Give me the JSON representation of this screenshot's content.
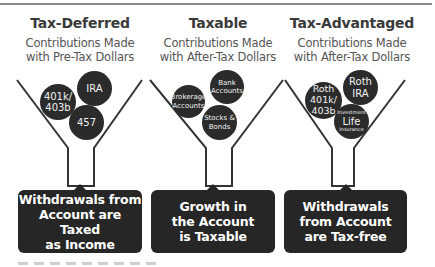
{
  "columns": [
    {
      "title": "Tax-Deferred",
      "subtitle_line1": "Contributions Made",
      "subtitle_line2": "with Pre-Tax Dollars",
      "accounts": [
        {
          "lines": [
            "401k/",
            "403b"
          ]
        },
        {
          "lines": [
            "IRA"
          ]
        },
        {
          "lines": [
            "457"
          ]
        }
      ],
      "outcome": [
        "Withdrawals from",
        "Account are Taxed",
        "as Income"
      ]
    },
    {
      "title": "Taxable",
      "subtitle_line1": "Contributions Made",
      "subtitle_line2": "with After-Tax Dollars",
      "accounts": [
        {
          "lines": [
            "Brokerage",
            "Accounts"
          ]
        },
        {
          "lines": [
            "Bank",
            "Accounts"
          ]
        },
        {
          "lines": [
            "Stocks &",
            "Bonds"
          ]
        }
      ],
      "outcome": [
        "Growth in",
        "the Account",
        "is Taxable"
      ]
    },
    {
      "title": "Tax-Advantaged",
      "subtitle_line1": "Contributions Made",
      "subtitle_line2": "with After-Tax Dollars",
      "accounts": [
        {
          "lines": [
            "Roth",
            "401k/",
            "403b"
          ]
        },
        {
          "lines": [
            "Roth",
            "IRA"
          ]
        },
        {
          "lines": [
            "Investment",
            "Life",
            "Insurance"
          ]
        }
      ],
      "outcome": [
        "Withdrawals",
        "from Account",
        "are Tax-free"
      ]
    }
  ],
  "colors": {
    "ball": "#2b2b2b",
    "box": "#262626",
    "funnel_stroke": "#333333",
    "title": "#3a3a3a",
    "subtitle": "#555555"
  }
}
